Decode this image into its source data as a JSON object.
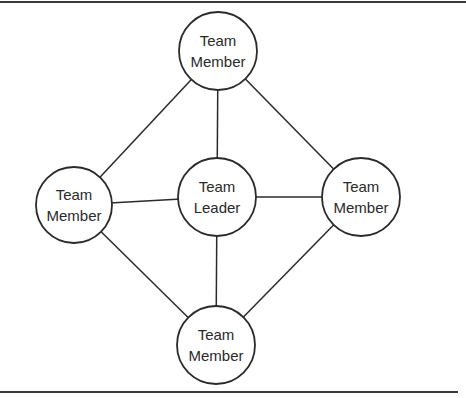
{
  "diagram": {
    "title": "",
    "type": "team-structure-network",
    "stroke_color": "#2a2a2a",
    "background": "#ffffff",
    "nodes": [
      {
        "id": "top",
        "role": "member",
        "lines": [
          "Team",
          "Member"
        ],
        "cx": 218,
        "cy": 51,
        "r": 39
      },
      {
        "id": "left",
        "role": "member",
        "lines": [
          "Team",
          "Member"
        ],
        "cx": 74,
        "cy": 205,
        "r": 38
      },
      {
        "id": "center",
        "role": "leader",
        "lines": [
          "Team",
          "Leader"
        ],
        "cx": 217,
        "cy": 197,
        "r": 39
      },
      {
        "id": "right",
        "role": "member",
        "lines": [
          "Team",
          "Member"
        ],
        "cx": 361,
        "cy": 197,
        "r": 39
      },
      {
        "id": "bottom",
        "role": "member",
        "lines": [
          "Team",
          "Member"
        ],
        "cx": 216,
        "cy": 345,
        "r": 39
      }
    ],
    "edges": [
      {
        "from": "top",
        "to": "left"
      },
      {
        "from": "top",
        "to": "right"
      },
      {
        "from": "top",
        "to": "center"
      },
      {
        "from": "left",
        "to": "center"
      },
      {
        "from": "center",
        "to": "right"
      },
      {
        "from": "left",
        "to": "bottom"
      },
      {
        "from": "right",
        "to": "bottom"
      },
      {
        "from": "center",
        "to": "bottom"
      }
    ]
  }
}
